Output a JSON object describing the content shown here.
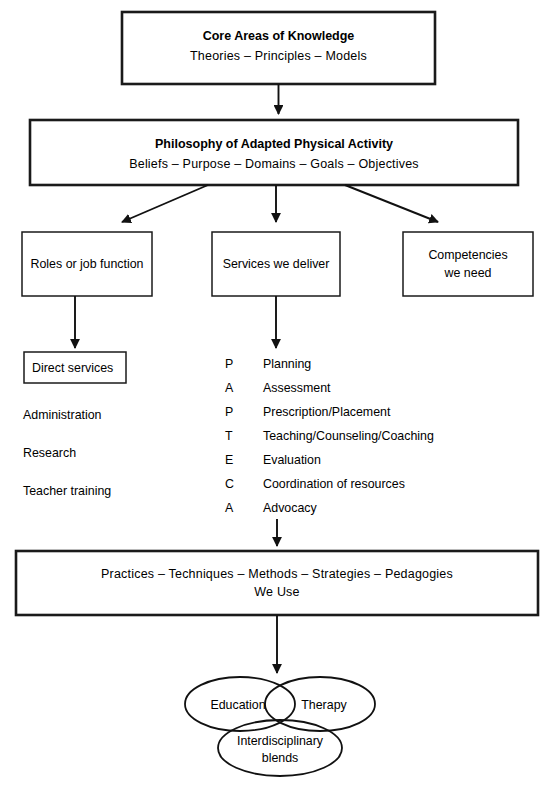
{
  "figure": {
    "type": "flowchart",
    "orientation": "top-to-bottom"
  },
  "core_areas_box": {
    "title": "Core Areas of Knowledge",
    "subtitle": "Theories   –   Principles   –   Models"
  },
  "philosophy_box": {
    "title": "Philosophy of Adapted Physical Activity",
    "subtitle": "Beliefs   –   Purpose   –   Domains   –   Goals   –   Objectives"
  },
  "branch_boxes": [
    {
      "label": "Roles or job function"
    },
    {
      "label": "Services we deliver"
    },
    {
      "label_line1": "Competencies",
      "label_line2": "we need"
    }
  ],
  "roles_column": {
    "boxed_item": "Direct services",
    "items": [
      "Administration",
      "Research",
      "Teacher training"
    ]
  },
  "services_column": {
    "entries": [
      {
        "letter": "P",
        "label": "Planning"
      },
      {
        "letter": "A",
        "label": "Assessment"
      },
      {
        "letter": "P",
        "label": "Prescription/Placement"
      },
      {
        "letter": "T",
        "label": "Teaching/Counseling/Coaching"
      },
      {
        "letter": "E",
        "label": "Evaluation"
      },
      {
        "letter": "C",
        "label": "Coordination of resources"
      },
      {
        "letter": "A",
        "label": "Advocacy"
      }
    ]
  },
  "practices_box": {
    "line1": "Practices   –   Techniques   –   Methods   –   Strategies   –   Pedagogies",
    "line2": "We Use"
  },
  "venn": {
    "left_label": "Education",
    "right_label": "Therapy",
    "bottom_label_line1": "Interdisciplinary",
    "bottom_label_line2": "blends"
  },
  "colors": {
    "stroke": "#111111",
    "background": "#ffffff",
    "text": "#000000"
  }
}
